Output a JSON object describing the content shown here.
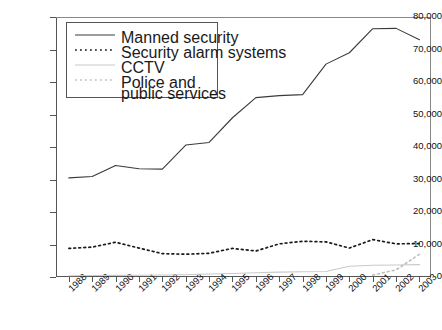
{
  "chart_data": {
    "type": "line",
    "title": "",
    "xlabel": "",
    "ylabel": "",
    "grid": false,
    "legend_position": "top-left-inside",
    "ylim": [
      0,
      80000
    ],
    "ytick_labels": [
      "80,000",
      "70,000",
      "60,000",
      "50,000",
      "40,000",
      "30,000",
      "20,000",
      "10,000",
      "0"
    ],
    "ytick_values": [
      80000,
      70000,
      60000,
      50000,
      40000,
      30000,
      20000,
      10000,
      0
    ],
    "categories": [
      "1988",
      "1989",
      "1990",
      "1991",
      "1992",
      "1993",
      "1994",
      "1995",
      "1996",
      "1997",
      "1998",
      "1999",
      "2000",
      "2001",
      "2002",
      "2003"
    ],
    "series": [
      {
        "name": "Manned security",
        "style": "solid",
        "color": "#3a3a3a",
        "values": [
          30500,
          30900,
          34300,
          33300,
          33200,
          40600,
          41400,
          49000,
          55200,
          55800,
          56100,
          65500,
          69000,
          76400,
          76500,
          73000
        ]
      },
      {
        "name": "Security alarm systems",
        "style": "dotted",
        "color": "#1a1a1a",
        "values": [
          8800,
          9200,
          10700,
          8900,
          7200,
          7000,
          7300,
          8800,
          8000,
          10200,
          11000,
          10800,
          8900,
          11500,
          10200,
          10300
        ]
      },
      {
        "name": "CCTV",
        "style": "solid",
        "color": "#c9c9c9",
        "values": [
          400,
          450,
          500,
          550,
          600,
          700,
          900,
          1100,
          1300,
          1500,
          1600,
          1700,
          3300,
          3600,
          3700,
          3800
        ]
      },
      {
        "name": "Police and public services",
        "style": "dotted",
        "color": "#c0c0c0",
        "values": [
          null,
          null,
          null,
          null,
          null,
          null,
          null,
          null,
          null,
          null,
          null,
          null,
          null,
          600,
          2200,
          7000
        ]
      }
    ]
  },
  "legend": {
    "items": [
      {
        "label": "Manned security"
      },
      {
        "label": "Security alarm systems"
      },
      {
        "label": "CCTV"
      },
      {
        "label": "Police and"
      },
      {
        "label": "public services"
      }
    ]
  }
}
